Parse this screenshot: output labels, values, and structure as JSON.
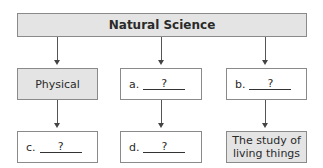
{
  "diagram": {
    "root": {
      "label": "Natural Science"
    },
    "branches": [
      {
        "middle": {
          "label": "Physical",
          "style": "filled"
        },
        "bottom": {
          "prefix": "c.",
          "blank": "?",
          "style": "outlined"
        }
      },
      {
        "middle": {
          "prefix": "a.",
          "blank": "?",
          "style": "outlined"
        },
        "bottom": {
          "prefix": "d.",
          "blank": "?",
          "style": "outlined"
        }
      },
      {
        "middle": {
          "prefix": "b.",
          "blank": "?",
          "style": "outlined"
        },
        "bottom": {
          "label_line1": "The study of",
          "label_line2": "living things",
          "style": "filled"
        }
      }
    ],
    "colors": {
      "filled_box": "#e4e4e4",
      "border": "#8a8a8a",
      "arrow": "#444444"
    }
  }
}
